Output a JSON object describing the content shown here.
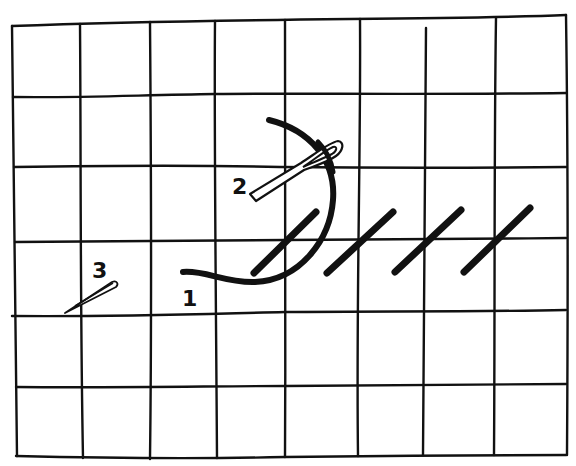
{
  "figure": {
    "colors": {
      "ink": "#111111",
      "paper": "#ffffff"
    },
    "grid": {
      "columns": 8,
      "rows": 6,
      "vertical_lines_x": [
        12,
        80,
        150,
        215,
        285,
        360,
        425,
        496,
        566
      ],
      "horizontal_lines_y": [
        25,
        97,
        167,
        240,
        315,
        385,
        455
      ]
    },
    "labels": [
      {
        "id": "step-1",
        "text": "1"
      },
      {
        "id": "step-2",
        "text": "2"
      },
      {
        "id": "step-3",
        "text": "3"
      }
    ],
    "elements": {
      "thread": "curved-thread",
      "needle_main": "needle-at-step-2",
      "needle_small": "needle-at-step-3",
      "stitch_count": 4
    }
  }
}
